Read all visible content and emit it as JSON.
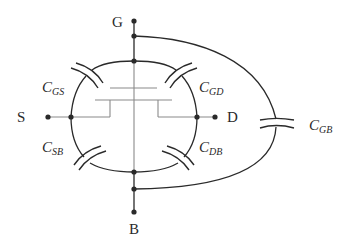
{
  "diagram": {
    "type": "mosfet-parasitic-capacitance-model",
    "terminals": {
      "gate": "G",
      "source": "S",
      "drain": "D",
      "body": "B"
    },
    "capacitors": [
      {
        "id": "cgs",
        "main": "C",
        "sub": "GS",
        "between": [
          "G",
          "S"
        ]
      },
      {
        "id": "cgd",
        "main": "C",
        "sub": "GD",
        "between": [
          "G",
          "D"
        ]
      },
      {
        "id": "csb",
        "main": "C",
        "sub": "SB",
        "between": [
          "S",
          "B"
        ]
      },
      {
        "id": "cdb",
        "main": "C",
        "sub": "DB",
        "between": [
          "D",
          "B"
        ]
      },
      {
        "id": "cgb",
        "main": "C",
        "sub": "GB",
        "between": [
          "G",
          "B"
        ]
      }
    ],
    "colors": {
      "line": "#2a2a2a",
      "transistor": "#8a8a8a",
      "background": "#ffffff"
    }
  }
}
